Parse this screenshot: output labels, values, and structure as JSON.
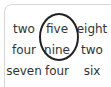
{
  "grid": {
    "rows": [
      [
        "two",
        "five",
        "eight"
      ],
      [
        "four",
        "nine",
        "two"
      ],
      [
        "seven",
        "four",
        "six"
      ]
    ]
  },
  "annotation": {
    "shape": "oval",
    "circled_words": [
      "five",
      "nine"
    ],
    "color": "#222222"
  }
}
